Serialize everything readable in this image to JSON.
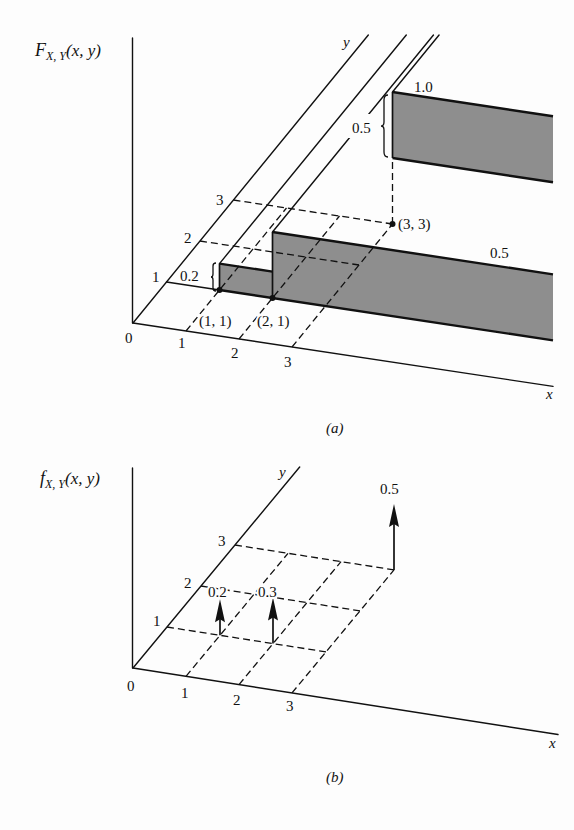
{
  "colors": {
    "ink": "#111111",
    "fill": "#8e8e8e",
    "background": "#fdfdfd"
  },
  "panel_a": {
    "z_label": {
      "func": "F",
      "sub": "X, Y",
      "args": "(x, y)"
    },
    "x_label": "x",
    "y_label": "y",
    "origin": "0",
    "x_ticks": [
      "1",
      "2",
      "3"
    ],
    "y_ticks": [
      "1",
      "2",
      "3"
    ],
    "point_labels": {
      "p11": "(1, 1)",
      "p21": "(2, 1)",
      "p33": "(3, 3)"
    },
    "jump_labels": {
      "at_11": "0.2",
      "at_33": "0.5"
    },
    "level_labels": {
      "plateau": "0.5",
      "top": "1.0"
    },
    "caption": "(a)"
  },
  "panel_b": {
    "z_label": {
      "func": "f",
      "sub": "X, Y",
      "args": "(x, y)"
    },
    "x_label": "x",
    "y_label": "y",
    "origin": "0",
    "x_ticks": [
      "1",
      "2",
      "3"
    ],
    "y_ticks": [
      "1",
      "2",
      "3"
    ],
    "impulse_labels": [
      "0.2",
      "0.3",
      "0.5"
    ],
    "caption": "(b)"
  },
  "chart_data": [
    {
      "type": "area",
      "title": "F_{X,Y}(x, y)",
      "caption": "(a)",
      "xlabel": "x",
      "ylabel": "y",
      "zlabel": "F_{X,Y}(x, y)",
      "x_ticks": [
        1,
        2,
        3
      ],
      "y_ticks": [
        1,
        2,
        3
      ],
      "grid": "dashed",
      "steps": [
        {
          "x": 1,
          "y": 1,
          "jump": 0.2,
          "level": 0.2
        },
        {
          "x": 2,
          "y": 1,
          "jump": 0.3,
          "level": 0.5
        },
        {
          "x": 3,
          "y": 3,
          "jump": 0.5,
          "level": 1.0
        }
      ],
      "regions": [
        {
          "x": [
            1,
            2
          ],
          "y": [
            1,
            null
          ],
          "value": 0.2
        },
        {
          "x": [
            2,
            null
          ],
          "y": [
            1,
            3
          ],
          "value": 0.5
        },
        {
          "x": [
            2,
            3
          ],
          "y": [
            3,
            null
          ],
          "value": 0.5
        },
        {
          "x": [
            3,
            null
          ],
          "y": [
            3,
            null
          ],
          "value": 1.0
        }
      ],
      "annotations": [
        "0.2",
        "0.5",
        "1.0",
        "0.5",
        "(1, 1)",
        "(2, 1)",
        "(3, 3)"
      ]
    },
    {
      "type": "bar",
      "title": "f_{X,Y}(x, y)",
      "caption": "(b)",
      "xlabel": "x",
      "ylabel": "y",
      "zlabel": "f_{X,Y}(x, y)",
      "x_ticks": [
        1,
        2,
        3
      ],
      "y_ticks": [
        1,
        2,
        3
      ],
      "grid": "dashed",
      "points": [
        {
          "x": 1,
          "y": 1,
          "value": 0.2
        },
        {
          "x": 2,
          "y": 1,
          "value": 0.3
        },
        {
          "x": 3,
          "y": 3,
          "value": 0.5
        }
      ]
    }
  ]
}
